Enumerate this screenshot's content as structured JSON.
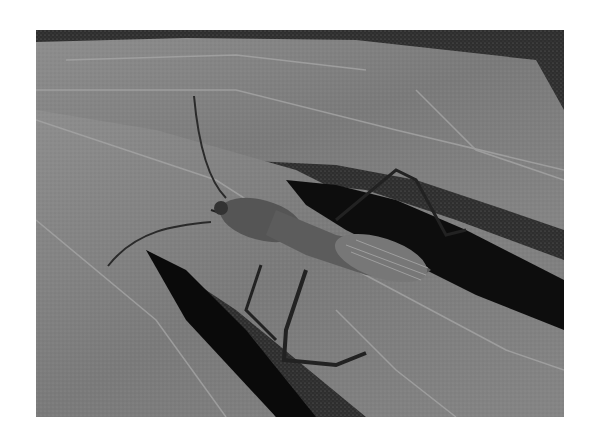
{
  "image": {
    "alt": "Grayscale photograph of a leaf-footed bug with long antennae and legs resting on a large veined leaf",
    "subject": "leaf-footed bug on leaf",
    "colors": {
      "background": "#ffffff",
      "leaf_light": "#8c8c8c",
      "leaf_mid": "#6f6f6f",
      "shadow": "#0a0a0a",
      "insect": "#4a4a4a",
      "vein": "#a8a8a8"
    }
  }
}
